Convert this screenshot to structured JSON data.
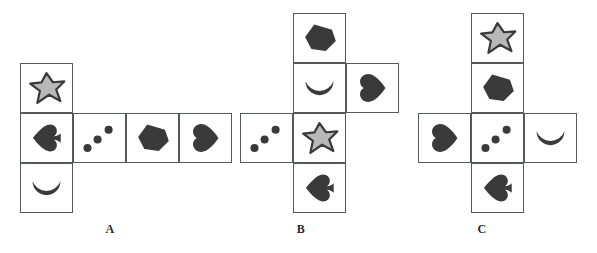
{
  "page": {
    "background_color": "#ffffff",
    "width": 597,
    "height": 253
  },
  "colors": {
    "border": "#55585c",
    "shape_dark": "#3a3a3a",
    "star_fill": "#b8b8b8",
    "star_outline": "#3a3a3a",
    "label_text": "#2b2b2b",
    "background": "#ffffff"
  },
  "symbols": {
    "star": "star-shape",
    "spade": "spade-shape",
    "crescent": "crescent-shape",
    "dots": "three-dots-shape",
    "pentagon": "pentagon-shape",
    "heart": "heart-shape"
  },
  "figures": [
    {
      "id": "A",
      "label": "A",
      "label_x": 110,
      "label_y": 222,
      "origin_x": 20,
      "origin_y": 63,
      "cells": [
        {
          "name": "cell-a-top",
          "symbol": "star",
          "col": 0,
          "row": 0
        },
        {
          "name": "cell-a-mid-1",
          "symbol": "spade",
          "col": 0,
          "row": 1
        },
        {
          "name": "cell-a-mid-2",
          "symbol": "dots",
          "col": 1,
          "row": 1
        },
        {
          "name": "cell-a-mid-3",
          "symbol": "pentagon",
          "col": 2,
          "row": 1
        },
        {
          "name": "cell-a-mid-4",
          "symbol": "heart",
          "col": 3,
          "row": 1
        },
        {
          "name": "cell-a-bottom",
          "symbol": "crescent",
          "col": 0,
          "row": 2
        }
      ]
    },
    {
      "id": "B",
      "label": "B",
      "label_x": 301,
      "label_y": 222,
      "origin_x": 240,
      "origin_y": 13,
      "cells": [
        {
          "name": "cell-b-row0-c1",
          "symbol": "pentagon",
          "col": 1,
          "row": 0
        },
        {
          "name": "cell-b-row1-c1",
          "symbol": "crescent",
          "col": 1,
          "row": 1
        },
        {
          "name": "cell-b-row1-c2",
          "symbol": "heart",
          "col": 2,
          "row": 1
        },
        {
          "name": "cell-b-row2-c0",
          "symbol": "dots",
          "col": 0,
          "row": 2
        },
        {
          "name": "cell-b-row2-c1",
          "symbol": "star",
          "col": 1,
          "row": 2
        },
        {
          "name": "cell-b-row3-c1",
          "symbol": "spade",
          "col": 1,
          "row": 3
        }
      ]
    },
    {
      "id": "C",
      "label": "C",
      "label_x": 482,
      "label_y": 222,
      "origin_x": 418,
      "origin_y": 13,
      "cells": [
        {
          "name": "cell-c-row0-c1",
          "symbol": "star",
          "col": 1,
          "row": 0
        },
        {
          "name": "cell-c-row1-c1",
          "symbol": "pentagon",
          "col": 1,
          "row": 1
        },
        {
          "name": "cell-c-row2-c0",
          "symbol": "heart",
          "col": 0,
          "row": 2
        },
        {
          "name": "cell-c-row2-c1",
          "symbol": "dots",
          "col": 1,
          "row": 2
        },
        {
          "name": "cell-c-row2-c2",
          "symbol": "crescent",
          "col": 2,
          "row": 2
        },
        {
          "name": "cell-c-row3-c1",
          "symbol": "spade",
          "col": 1,
          "row": 3
        }
      ]
    }
  ],
  "cell_size": {
    "width": 53,
    "height": 50
  }
}
